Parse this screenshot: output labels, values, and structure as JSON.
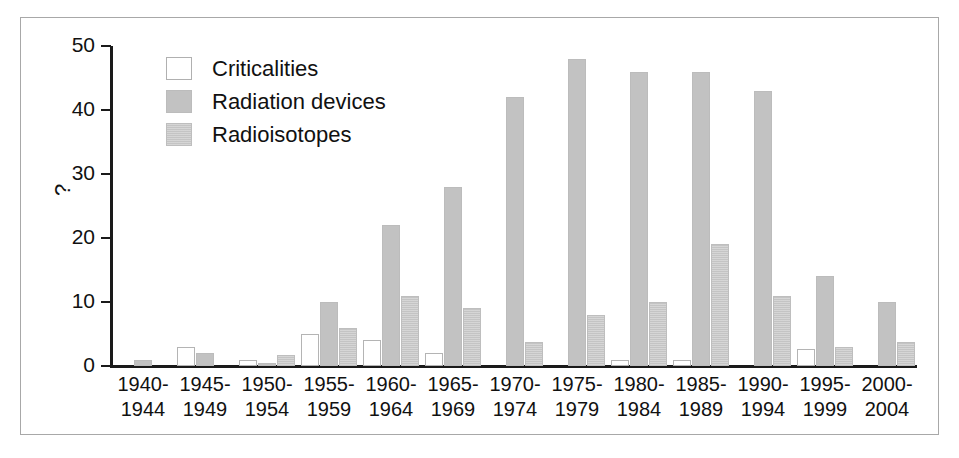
{
  "chart_data": {
    "type": "bar",
    "title": "",
    "xlabel": "",
    "ylabel": "?",
    "ylim": [
      0,
      50
    ],
    "yticks": [
      0,
      10,
      20,
      30,
      40,
      50
    ],
    "grid": false,
    "legend_position": "top-left",
    "categories": [
      "1940-\n1944",
      "1945-\n1949",
      "1950-\n1954",
      "1955-\n1959",
      "1960-\n1964",
      "1965-\n1969",
      "1970-\n1974",
      "1975-\n1979",
      "1980-\n1984",
      "1985-\n1989",
      "1990-\n1994",
      "1995-\n1999",
      "2000-\n2004"
    ],
    "category_lines": [
      [
        "1940-",
        "1944"
      ],
      [
        "1945-",
        "1949"
      ],
      [
        "1950-",
        "1954"
      ],
      [
        "1955-",
        "1959"
      ],
      [
        "1960-",
        "1964"
      ],
      [
        "1965-",
        "1969"
      ],
      [
        "1970-",
        "1974"
      ],
      [
        "1975-",
        "1979"
      ],
      [
        "1980-",
        "1984"
      ],
      [
        "1985-",
        "1989"
      ],
      [
        "1990-",
        "1994"
      ],
      [
        "1995-",
        "1999"
      ],
      [
        "2000-",
        "2004"
      ]
    ],
    "series": [
      {
        "name": "Criticalities",
        "color": "#ffffff",
        "values": [
          0,
          3,
          1,
          5,
          4,
          2,
          0,
          0,
          1,
          1,
          0,
          2.7,
          0
        ]
      },
      {
        "name": "Radiation devices",
        "color": "#c2c2c2",
        "values": [
          1,
          2,
          0.5,
          10,
          22,
          28,
          42,
          48,
          46,
          46,
          43,
          14,
          10
        ]
      },
      {
        "name": "Radioisotopes",
        "color": "#c4c4c4",
        "values": [
          0,
          0,
          1.7,
          6,
          11,
          9,
          3.7,
          8,
          10,
          19,
          11,
          2.9,
          3.7
        ]
      }
    ]
  },
  "legend": {
    "items": [
      {
        "label": "Criticalities",
        "swatch": "criticalities"
      },
      {
        "label": "Radiation devices",
        "swatch": "devices"
      },
      {
        "label": "Radioisotopes",
        "swatch": "isotopes"
      }
    ]
  },
  "axis": {
    "y_title": "?",
    "y_tick_labels": [
      "50",
      "40",
      "30",
      "20",
      "10",
      "0"
    ]
  },
  "colors": {
    "frame": "#a8a8a8",
    "axis": "#1a1a1a",
    "criticalities": "#ffffff",
    "devices": "#c2c2c2",
    "isotopes": "#c4c4c4",
    "text": "#111111"
  }
}
